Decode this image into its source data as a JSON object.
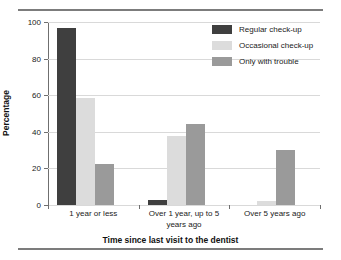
{
  "chart_data": {
    "type": "bar",
    "title": "",
    "xlabel": "Time since last visit to the dentist",
    "ylabel": "Percentage",
    "ylim": [
      0,
      100
    ],
    "ytick_values": [
      0,
      20,
      40,
      60,
      80,
      100
    ],
    "ytick_labels": [
      "0",
      "20",
      "40",
      "60",
      "80",
      "100"
    ],
    "grid": "horizontal",
    "legend_position": "top-right",
    "categories": [
      "1 year or less",
      "Over 1 year, up to 5 years ago",
      "Over 5 years ago"
    ],
    "category_lines": [
      [
        "1 year or less"
      ],
      [
        "Over 1 year, up to 5",
        "years ago"
      ],
      [
        "Over 5 years ago"
      ]
    ],
    "series": [
      {
        "name": "Regular check-up",
        "color": "#3f3f3f",
        "values": [
          96.5,
          2.5,
          0
        ]
      },
      {
        "name": "Occasional check-up",
        "color": "#dcdcdc",
        "values": [
          58.5,
          37.5,
          2
        ]
      },
      {
        "name": "Only with trouble",
        "color": "#9a9a9a",
        "values": [
          22.5,
          44.5,
          30
        ]
      }
    ]
  },
  "axis": {
    "y_label": "Percentage",
    "x_label": "Time since last visit to the dentist",
    "y_ticks": [
      "0",
      "20",
      "40",
      "60",
      "80",
      "100"
    ]
  },
  "legend": {
    "items": [
      {
        "label": "Regular check-up",
        "color": "#3f3f3f"
      },
      {
        "label": "Occasional check-up",
        "color": "#dcdcdc"
      },
      {
        "label": "Only with trouble",
        "color": "#9a9a9a"
      }
    ]
  },
  "categories": [
    {
      "line1": "1 year or less",
      "line2": ""
    },
    {
      "line1": "Over 1 year, up to 5",
      "line2": "years ago"
    },
    {
      "line1": "Over 5 years ago",
      "line2": ""
    }
  ]
}
